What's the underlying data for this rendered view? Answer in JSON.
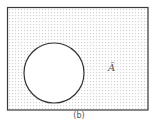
{
  "diagram": {
    "type": "venn",
    "universe": {
      "shape": "rectangle",
      "x": 7,
      "y": 7,
      "width": 141,
      "height": 103,
      "shaded": true,
      "pattern": "dotted-grid",
      "border_color": "#333333",
      "fill_dot_color": "#cfcfcf"
    },
    "sets": [
      {
        "name": "A",
        "shape": "circle",
        "cx": 54,
        "cy": 73,
        "r": 30,
        "shaded": false,
        "fill": "#ffffff",
        "stroke": "#333333"
      }
    ],
    "label": "Ā",
    "caption": "(b)"
  }
}
